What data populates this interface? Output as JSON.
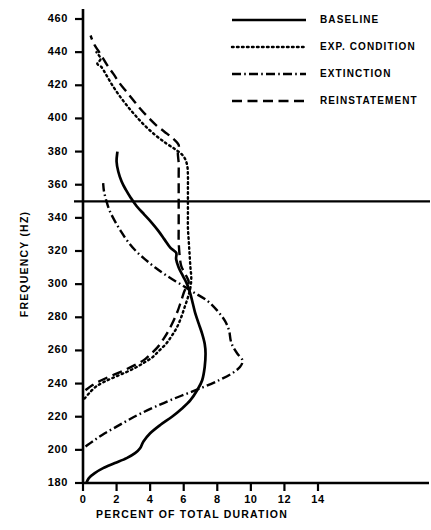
{
  "figure": {
    "xlabel": "PERCENT OF TOTAL DURATION",
    "ylabel": "FREQUENCY  (HZ)",
    "reference_line_value": 350,
    "ink": "#000000"
  },
  "axes": {
    "x_ticks": [
      "0",
      "2",
      "4",
      "6",
      "8",
      "10",
      "12",
      "14"
    ],
    "y_ticks": [
      "180",
      "200",
      "220",
      "240",
      "260",
      "280",
      "300",
      "320",
      "340",
      "360",
      "380",
      "400",
      "420",
      "440",
      "460"
    ]
  },
  "legend": {
    "items": [
      {
        "label": "BASELINE",
        "style": "solid"
      },
      {
        "label": "EXP. CONDITION",
        "style": "dotted"
      },
      {
        "label": "EXTINCTION",
        "style": "dashdot"
      },
      {
        "label": "REINSTATEMENT",
        "style": "dashed"
      }
    ]
  },
  "chart_data": {
    "type": "line",
    "orientation": "horizontal",
    "title": "",
    "xlabel": "PERCENT OF TOTAL DURATION",
    "ylabel": "FREQUENCY  (HZ)",
    "xlim": [
      0,
      15.6
    ],
    "ylim": [
      180,
      465
    ],
    "grid": false,
    "legend_position": "top-right",
    "reference_lines": [
      {
        "axis": "y",
        "value": 350
      }
    ],
    "series": [
      {
        "name": "BASELINE",
        "style": "solid",
        "points": [
          [
            0.2,
            180
          ],
          [
            0.35,
            183
          ],
          [
            0.7,
            186
          ],
          [
            1.2,
            189
          ],
          [
            1.9,
            192
          ],
          [
            2.6,
            195
          ],
          [
            3.1,
            198
          ],
          [
            3.4,
            201
          ],
          [
            3.6,
            205
          ],
          [
            4.0,
            210
          ],
          [
            4.6,
            215
          ],
          [
            5.3,
            220
          ],
          [
            5.9,
            225
          ],
          [
            6.4,
            230
          ],
          [
            6.8,
            236
          ],
          [
            7.1,
            242
          ],
          [
            7.25,
            250
          ],
          [
            7.3,
            258
          ],
          [
            7.25,
            264
          ],
          [
            7.1,
            270
          ],
          [
            6.9,
            276
          ],
          [
            6.7,
            282
          ],
          [
            6.55,
            288
          ],
          [
            6.4,
            294
          ],
          [
            6.2,
            300
          ],
          [
            5.95,
            305
          ],
          [
            5.7,
            310
          ],
          [
            5.55,
            315
          ],
          [
            5.55,
            319
          ],
          [
            5.2,
            322
          ],
          [
            4.85,
            327
          ],
          [
            4.5,
            332
          ],
          [
            4.1,
            337
          ],
          [
            3.65,
            342
          ],
          [
            3.2,
            347
          ],
          [
            2.85,
            352
          ],
          [
            2.55,
            357
          ],
          [
            2.3,
            362
          ],
          [
            2.1,
            368
          ],
          [
            2.0,
            374
          ],
          [
            2.05,
            380
          ]
        ]
      },
      {
        "name": "EXP. CONDITION",
        "style": "dotted",
        "points": [
          [
            0.1,
            231
          ],
          [
            0.35,
            234
          ],
          [
            0.75,
            238
          ],
          [
            1.25,
            241
          ],
          [
            1.9,
            244
          ],
          [
            2.6,
            247
          ],
          [
            3.2,
            250
          ],
          [
            3.7,
            253
          ],
          [
            4.15,
            256
          ],
          [
            4.55,
            260
          ],
          [
            4.95,
            264
          ],
          [
            5.3,
            269
          ],
          [
            5.6,
            274
          ],
          [
            5.85,
            280
          ],
          [
            6.05,
            286
          ],
          [
            6.25,
            292
          ],
          [
            6.4,
            298
          ],
          [
            6.45,
            304
          ],
          [
            6.4,
            310
          ],
          [
            6.35,
            318
          ],
          [
            6.3,
            326
          ],
          [
            6.25,
            334
          ],
          [
            6.25,
            342
          ],
          [
            6.25,
            350
          ],
          [
            6.25,
            358
          ],
          [
            6.25,
            366
          ],
          [
            6.2,
            372
          ],
          [
            6.0,
            377
          ],
          [
            5.55,
            381
          ],
          [
            4.95,
            385
          ],
          [
            4.3,
            390
          ],
          [
            3.65,
            396
          ],
          [
            3.1,
            402
          ],
          [
            2.6,
            408
          ],
          [
            2.15,
            414
          ],
          [
            1.75,
            420
          ],
          [
            1.4,
            426
          ],
          [
            1.1,
            431
          ],
          [
            0.85,
            433
          ],
          [
            1.05,
            436
          ],
          [
            0.8,
            440
          ]
        ]
      },
      {
        "name": "EXTINCTION",
        "style": "dashdot",
        "points": [
          [
            0.15,
            202
          ],
          [
            0.7,
            206
          ],
          [
            1.3,
            210
          ],
          [
            2.0,
            214
          ],
          [
            2.7,
            218
          ],
          [
            3.45,
            222
          ],
          [
            4.3,
            226
          ],
          [
            5.2,
            230
          ],
          [
            6.2,
            234
          ],
          [
            7.2,
            238
          ],
          [
            8.1,
            242
          ],
          [
            8.85,
            246
          ],
          [
            9.35,
            250
          ],
          [
            9.5,
            254
          ],
          [
            9.2,
            258
          ],
          [
            8.95,
            262
          ],
          [
            8.8,
            266
          ],
          [
            8.7,
            272
          ],
          [
            8.45,
            278
          ],
          [
            8.0,
            284
          ],
          [
            7.4,
            290
          ],
          [
            6.6,
            295
          ],
          [
            5.8,
            300
          ],
          [
            5.0,
            305
          ],
          [
            4.3,
            310
          ],
          [
            3.7,
            315
          ],
          [
            3.15,
            320
          ],
          [
            2.65,
            326
          ],
          [
            2.25,
            332
          ],
          [
            1.9,
            338
          ],
          [
            1.6,
            344
          ],
          [
            1.4,
            350
          ],
          [
            1.25,
            356
          ],
          [
            1.2,
            361
          ]
        ]
      },
      {
        "name": "REINSTATEMENT",
        "style": "dashed",
        "points": [
          [
            0.15,
            236
          ],
          [
            0.55,
            239
          ],
          [
            1.1,
            242
          ],
          [
            1.75,
            245
          ],
          [
            2.45,
            248
          ],
          [
            3.05,
            251
          ],
          [
            3.6,
            254
          ],
          [
            4.05,
            258
          ],
          [
            4.45,
            262
          ],
          [
            4.8,
            267
          ],
          [
            5.1,
            272
          ],
          [
            5.4,
            278
          ],
          [
            5.65,
            284
          ],
          [
            5.85,
            290
          ],
          [
            6.05,
            296
          ],
          [
            6.3,
            301
          ],
          [
            6.1,
            306
          ],
          [
            5.85,
            311
          ],
          [
            5.75,
            318
          ],
          [
            5.7,
            326
          ],
          [
            5.7,
            334
          ],
          [
            5.7,
            342
          ],
          [
            5.7,
            350
          ],
          [
            5.7,
            358
          ],
          [
            5.7,
            366
          ],
          [
            5.7,
            373
          ],
          [
            5.65,
            379
          ],
          [
            5.7,
            384
          ],
          [
            5.35,
            388
          ],
          [
            4.85,
            392
          ],
          [
            4.35,
            396
          ],
          [
            3.85,
            401
          ],
          [
            3.4,
            406
          ],
          [
            3.0,
            411
          ],
          [
            2.6,
            416
          ],
          [
            2.2,
            421
          ],
          [
            1.8,
            427
          ],
          [
            1.45,
            432
          ],
          [
            1.15,
            437
          ],
          [
            0.9,
            441
          ],
          [
            0.65,
            445
          ],
          [
            0.45,
            450
          ]
        ]
      }
    ]
  }
}
